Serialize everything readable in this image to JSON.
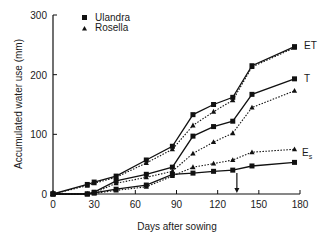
{
  "chart_data": {
    "type": "line",
    "title": "",
    "xlabel": "Days after sowing",
    "ylabel": "Accumulated water use (mm)",
    "xlim": [
      0,
      180
    ],
    "ylim": [
      0,
      300
    ],
    "x_ticks": [
      0,
      30,
      60,
      90,
      120,
      150,
      180
    ],
    "y_ticks": [
      0,
      100,
      200,
      300
    ],
    "grid": false,
    "legend": {
      "position": "upper-left",
      "entries": [
        {
          "label": "Ulandra",
          "marker": "square",
          "line": "solid"
        },
        {
          "label": "Rosella",
          "marker": "triangle",
          "line": "dotted"
        }
      ]
    },
    "x": [
      0,
      25,
      30,
      46,
      68,
      87,
      102,
      117,
      131,
      145,
      176
    ],
    "series": [
      {
        "name": "ET Ulandra",
        "cultivar": "Ulandra",
        "component": "ET",
        "marker": "square",
        "line": "solid",
        "values": [
          0,
          16,
          20,
          30,
          57,
          80,
          133,
          150,
          162,
          215,
          247
        ]
      },
      {
        "name": "ET Rosella",
        "cultivar": "Rosella",
        "component": "ET",
        "marker": "triangle",
        "line": "dotted",
        "values": [
          0,
          14,
          18,
          28,
          52,
          75,
          115,
          138,
          157,
          213,
          245
        ]
      },
      {
        "name": "T Ulandra",
        "cultivar": "Ulandra",
        "component": "T",
        "marker": "square",
        "line": "solid",
        "values": [
          0,
          0,
          3,
          22,
          33,
          45,
          97,
          113,
          122,
          167,
          193
        ]
      },
      {
        "name": "T Rosella",
        "cultivar": "Rosella",
        "component": "T",
        "marker": "triangle",
        "line": "dotted",
        "values": [
          0,
          0,
          2,
          18,
          28,
          38,
          68,
          87,
          102,
          145,
          173
        ]
      },
      {
        "name": "Es Ulandra",
        "cultivar": "Ulandra",
        "component": "Es",
        "marker": "square",
        "line": "solid",
        "values": [
          0,
          0,
          2,
          8,
          15,
          33,
          35,
          38,
          40,
          47,
          53
        ]
      },
      {
        "name": "Es Rosella",
        "cultivar": "Rosella",
        "component": "Es",
        "marker": "triangle",
        "line": "dotted",
        "values": [
          0,
          0,
          1,
          6,
          12,
          30,
          45,
          51,
          57,
          70,
          75
        ]
      }
    ],
    "annotations": [
      {
        "text": "ET",
        "x": 176,
        "y": 247
      },
      {
        "text": "T",
        "x": 176,
        "y": 193
      },
      {
        "text": "E",
        "subscript": "s",
        "x": 176,
        "y": 75
      },
      {
        "type": "arrow",
        "x": 134,
        "y_from": 35,
        "y_to": 0,
        "direction": "down"
      }
    ]
  },
  "labels": {
    "xlabel": "Days after sowing",
    "ylabel": "Accumulated water use (mm)",
    "legend_ulandra": "Ulandra",
    "legend_rosella": "Rosella",
    "label_et": "ET",
    "label_t": "T",
    "label_es_main": "E",
    "label_es_sub": "s"
  }
}
